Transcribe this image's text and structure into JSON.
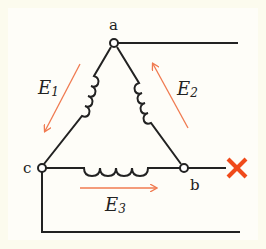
{
  "diagram": {
    "type": "delta-connected three-phase winding with open phase",
    "nodes": [
      {
        "id": "a",
        "label": "a"
      },
      {
        "id": "b",
        "label": "b"
      },
      {
        "id": "c",
        "label": "c"
      }
    ],
    "emfs": [
      {
        "id": "E1",
        "base": "E",
        "sub": "1",
        "direction": "a to c"
      },
      {
        "id": "E2",
        "base": "E",
        "sub": "2",
        "direction": "b to a"
      },
      {
        "id": "E3",
        "base": "E",
        "sub": "3",
        "direction": "c to b"
      }
    ],
    "fault": {
      "symbol": "×",
      "location": "line from b",
      "meaning": "open circuit"
    },
    "colors": {
      "wire": "#222222",
      "arrow": "#f07a50",
      "fault": "#f04a1a",
      "background": "#fcfbee",
      "panel": "#ffffff"
    }
  }
}
